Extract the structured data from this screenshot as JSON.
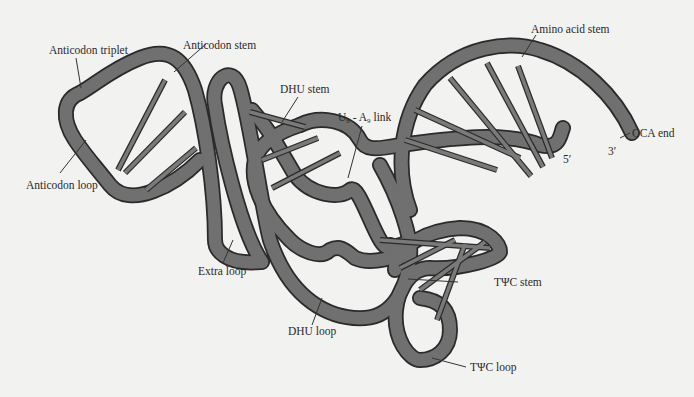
{
  "diagram": {
    "labels": {
      "anticodon_triplet": "Anticodon triplet",
      "anticodon_stem": "Anticodon stem",
      "anticodon_loop": "Anticodon loop",
      "dhu_stem": "DHU stem",
      "u8_a9_link_U": "U",
      "u8_a9_link_U_sub": "8",
      "u8_a9_link_sep": " - A",
      "u8_a9_link_A_sub": "9",
      "u8_a9_link_text": " link",
      "amino_acid_stem": "Amino acid stem",
      "cca_end": "CCA end",
      "five_prime": "5′",
      "three_prime": "3′",
      "extra_loop": "Extra loop",
      "dhu_loop": "DHU loop",
      "tpsic_stem": "TΨC stem",
      "tpsic_loop": "TΨC loop"
    },
    "colors": {
      "background": "#f2f2f0",
      "ribbon": "#707070",
      "outline": "#2a2a2a",
      "text": "#2a2a2a"
    }
  }
}
